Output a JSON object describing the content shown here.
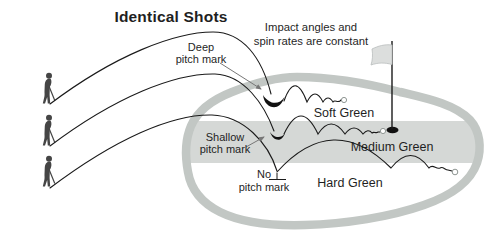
{
  "figure": {
    "title": "Identical Shots",
    "annotation": {
      "line1": "Impact angles and",
      "line2": "spin rates are constant"
    },
    "pitch_labels": {
      "deep": {
        "line1": "Deep",
        "line2": "pitch mark"
      },
      "shallow": {
        "line1": "Shallow",
        "line2": "pitch mark"
      },
      "none": {
        "line1": "No",
        "line2": "pitch mark"
      }
    },
    "green_labels": {
      "soft": "Soft Green",
      "medium": "Medium Green",
      "hard": "Hard Green"
    },
    "icons": {
      "golfer": "golfer-figure",
      "flag": "pin-flag",
      "ball": "golf-ball",
      "hole": "cup-hole",
      "deep_mark": "deep-pitch-mark",
      "shallow_mark": "shallow-pitch-mark",
      "pointer": "pointer-arrow",
      "no_mark_ground": "ground-tick"
    },
    "colors": {
      "green_outline": "#c2c7c4",
      "medium_band": "#d5d8d6",
      "line": "#1a1a1a",
      "text": "#1f1f1f",
      "flag_fill": "#dcdedd",
      "arrow": "#777777"
    }
  }
}
